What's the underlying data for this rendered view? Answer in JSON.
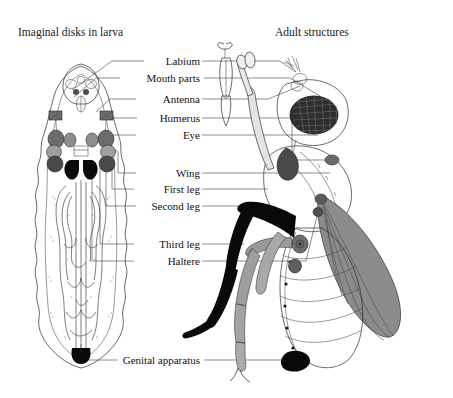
{
  "figure": {
    "background_color": "#ffffff"
  },
  "headings": {
    "left": "Imaginal disks in larva",
    "right": "Adult structures"
  },
  "labels": [
    {
      "id": "labium",
      "text": "Labium",
      "y": 61
    },
    {
      "id": "mouth-parts",
      "text": "Mouth parts",
      "y": 78
    },
    {
      "id": "antenna",
      "text": "Antenna",
      "y": 99
    },
    {
      "id": "humerus",
      "text": "Humerus",
      "y": 118
    },
    {
      "id": "eye",
      "text": "Eye",
      "y": 135
    },
    {
      "id": "wing",
      "text": "Wing",
      "y": 173
    },
    {
      "id": "first-leg",
      "text": "First leg",
      "y": 189
    },
    {
      "id": "second-leg",
      "text": "Second leg",
      "y": 206
    },
    {
      "id": "third-leg",
      "text": "Third leg",
      "y": 244
    },
    {
      "id": "haltere",
      "text": "Haltere",
      "y": 261
    },
    {
      "id": "genital-apparatus",
      "text": "Genital apparatus",
      "y": 360
    }
  ],
  "colors": {
    "background": "#ffffff",
    "outline": "#2a2a2a",
    "leader_line": "#5c5c5c",
    "text": "#111111",
    "disk_dark": "#3b3b3b",
    "disk_mid": "#7a7a7a",
    "disk_light": "#a8a8a8",
    "disk_black": "#0a0a0a",
    "wing_fill": "#8c8c8c",
    "leg_black": "#080808",
    "leg_gray": "#9a9a9a",
    "eye_fill": "#2e2e2e"
  },
  "organisms": {
    "larva": {
      "name": "drosophila-larva",
      "description": "Ventral view of larva showing paired imaginal disks in the anterior region and looping internal structures"
    },
    "adult": {
      "name": "drosophila-adult",
      "description": "Lateral view of adult fly with compound eye, proboscis, wing, halteres, three pairs of legs and genital apparatus"
    }
  }
}
